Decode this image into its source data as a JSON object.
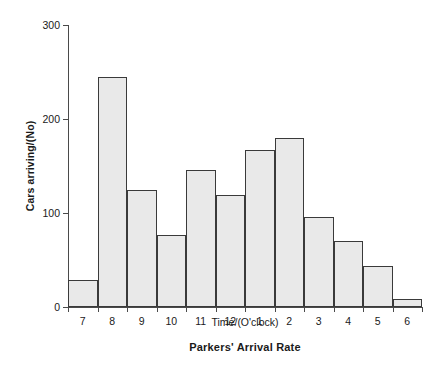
{
  "chart_data": {
    "type": "bar",
    "title": "Parkers' Arrival Rate",
    "xlabel": "Time/(O'clock)",
    "ylabel": "Cars arriving/(No)",
    "categories": [
      "7",
      "8",
      "9",
      "10",
      "11",
      "12",
      "1",
      "2",
      "3",
      "4",
      "5",
      "6"
    ],
    "values": [
      29,
      245,
      125,
      77,
      146,
      119,
      167,
      180,
      96,
      70,
      44,
      8
    ],
    "ylim": [
      0,
      300
    ],
    "yticks": [
      0,
      100,
      200,
      300
    ],
    "ytick_labels": [
      "0",
      "100",
      "200",
      "300"
    ],
    "grid": false,
    "legend": "none",
    "bar_fill_color": "#e9e9e9",
    "bar_edge_color": "#3a3a3a",
    "axis_color": "#4a4a4a",
    "background_color": "#ffffff",
    "bar_gap": 0
  }
}
